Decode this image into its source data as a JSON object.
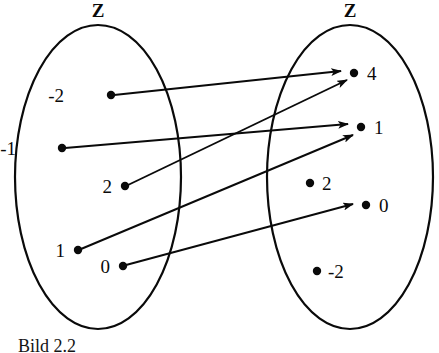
{
  "figure": {
    "type": "mapping-diagram",
    "caption": "Bild 2.2",
    "domain_set": {
      "name": "Z",
      "elements": [
        "-2",
        "-1",
        "2",
        "1",
        "0"
      ]
    },
    "codomain_set": {
      "name": "Z",
      "elements": [
        "4",
        "1",
        "2",
        "0",
        "-2"
      ]
    },
    "arrows": [
      {
        "from": "-2",
        "to": "4"
      },
      {
        "from": "-1",
        "to": "1"
      },
      {
        "from": "2",
        "to": "4"
      },
      {
        "from": "1",
        "to": "1"
      },
      {
        "from": "0",
        "to": "0"
      }
    ],
    "colors": {
      "ink": "#0a0a0a",
      "background": "#ffffff"
    }
  },
  "geometry": {
    "domain_nodes": [
      {
        "label": "-2",
        "dot_x": 111,
        "dot_y": 95,
        "label_x": 64,
        "label_y": 86
      },
      {
        "label": "-1",
        "dot_x": 62,
        "dot_y": 148,
        "label_x": 16,
        "label_y": 139
      },
      {
        "label": "2",
        "dot_x": 125,
        "dot_y": 186,
        "label_x": 92,
        "label_y": 177
      },
      {
        "label": "1",
        "dot_x": 78,
        "dot_y": 250,
        "label_x": 50,
        "label_y": 241
      },
      {
        "label": "0",
        "dot_x": 123,
        "dot_y": 266,
        "label_x": 92,
        "label_y": 257
      }
    ],
    "codomain_nodes": [
      {
        "label": "4",
        "dot_x": 354,
        "dot_y": 73,
        "label_x": 367,
        "label_y": 64
      },
      {
        "label": "1",
        "dot_x": 361,
        "dot_y": 127,
        "label_x": 374,
        "label_y": 118
      },
      {
        "label": "2",
        "dot_x": 310,
        "dot_y": 183,
        "label_x": 322,
        "label_y": 174
      },
      {
        "label": "0",
        "dot_x": 366,
        "dot_y": 205,
        "label_x": 379,
        "label_y": 196
      },
      {
        "label": "-2",
        "dot_x": 317,
        "dot_y": 271,
        "label_x": 328,
        "label_y": 262
      }
    ],
    "edges": [
      {
        "id": "e1",
        "x1": 114,
        "y1": 95,
        "x2": 341,
        "y2": 71
      },
      {
        "id": "e2",
        "x1": 65,
        "y1": 148,
        "x2": 348,
        "y2": 124
      },
      {
        "id": "e3",
        "x1": 128,
        "y1": 185,
        "x2": 347,
        "y2": 80
      },
      {
        "id": "e4",
        "x1": 81,
        "y1": 249,
        "x2": 353,
        "y2": 135
      },
      {
        "id": "e5",
        "x1": 126,
        "y1": 265,
        "x2": 353,
        "y2": 204
      }
    ]
  }
}
